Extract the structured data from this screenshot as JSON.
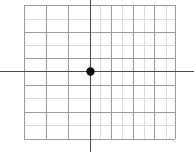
{
  "figure": {
    "width": 194,
    "height": 152,
    "background_color": "#ffffff"
  },
  "chart_data": {
    "type": "scatter",
    "title": "",
    "subtitle": "",
    "xlabel": "",
    "ylabel": "",
    "xlim": [
      -4,
      3
    ],
    "ylim": [
      -3,
      2
    ],
    "xticks": [
      -4,
      -3,
      -2,
      -1,
      0,
      1,
      2,
      3
    ],
    "yticks": [
      -3,
      -2,
      -1,
      0,
      1,
      2
    ],
    "xticklabels": [
      "",
      "",
      "",
      "",
      "",
      "",
      "",
      ""
    ],
    "yticklabels": [
      "",
      "",
      "",
      "",
      "",
      ""
    ],
    "grid": true,
    "legend": null,
    "legend_position": "none",
    "annotations": [],
    "series": [
      {
        "name": "origin-point",
        "marker": "circle",
        "color": "#111111",
        "marker_size": 8,
        "x": [
          0
        ],
        "y": [
          0
        ]
      }
    ]
  },
  "axes": {
    "x_axis": {
      "name": "horizontal-axis",
      "color": "#4a4a4a",
      "width": 1.6,
      "y_position_px": 71,
      "extends_full_width": true
    },
    "y_axis": {
      "name": "vertical-axis",
      "color": "#4a4a4a",
      "width": 1.6,
      "x_position_px": 90,
      "extends_full_height": true
    }
  },
  "grid_style": {
    "major_color": "#9a9a9a",
    "minor_color": "#d8d8d8",
    "line_width": 0.9,
    "columns": 7,
    "rows": 5
  },
  "grid_geometry": {
    "left_px": 24,
    "right_px": 175,
    "top_px": 5,
    "bottom_px": 139,
    "vertical_lines_px": [
      24,
      46,
      68,
      90,
      111,
      133,
      154,
      175
    ],
    "horizontal_lines_px": [
      5,
      32,
      58,
      71,
      85,
      112,
      139
    ],
    "faint_vertical_lines_px": [
      100,
      122,
      144,
      166
    ],
    "faint_horizontal_lines_px": [
      19,
      45,
      98,
      125
    ]
  },
  "origin_marker": {
    "name": "origin-dot",
    "center_x_px": 90,
    "center_y_px": 71,
    "radius_px": 4.2,
    "fill": "#0d0d0d"
  }
}
